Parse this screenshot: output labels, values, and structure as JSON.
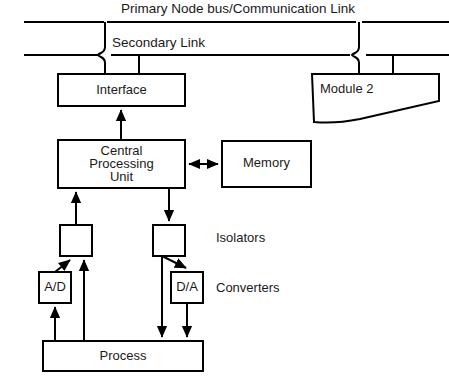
{
  "diagram": {
    "stroke_color": "#000000",
    "fill_color": "#ffffff",
    "text_color": "#1a1a1a",
    "labels": {
      "primary_bus": "Primary Node bus/Communication Link",
      "secondary_link": "Secondary Link",
      "interface": "Interface",
      "module_2": "Module 2",
      "cpu_line_1": "Central",
      "cpu_line_2": "Processing",
      "cpu_line_3": "Unit",
      "memory": "Memory",
      "isolators": "Isolators",
      "converters": "Converters",
      "analog_to_digital": "A/D",
      "digital_to_analog": "D/A",
      "process": "Process"
    },
    "blocks": [
      {
        "id": "interface",
        "label": "Interface",
        "x": 58,
        "y": 74,
        "w": 127,
        "h": 32
      },
      {
        "id": "module-2",
        "label": "Module 2",
        "x": 312,
        "y": 74,
        "w": 127,
        "h": 32
      },
      {
        "id": "cpu",
        "label": "Central Processing Unit",
        "x": 58,
        "y": 140,
        "w": 127,
        "h": 48
      },
      {
        "id": "memory",
        "label": "Memory",
        "x": 222,
        "y": 141,
        "w": 89,
        "h": 46
      },
      {
        "id": "isolator-left",
        "label": "",
        "x": 60,
        "y": 225,
        "w": 32,
        "h": 31
      },
      {
        "id": "isolator-right",
        "label": "",
        "x": 153,
        "y": 225,
        "w": 32,
        "h": 31
      },
      {
        "id": "ad-converter",
        "label": "A/D",
        "x": 39,
        "y": 272,
        "w": 32,
        "h": 31
      },
      {
        "id": "da-converter",
        "label": "D/A",
        "x": 171,
        "y": 272,
        "w": 32,
        "h": 31
      },
      {
        "id": "process",
        "label": "Process",
        "x": 43,
        "y": 341,
        "w": 160,
        "h": 30
      }
    ],
    "connections": [
      {
        "from": "primary-bus",
        "to": "interface",
        "type": "line"
      },
      {
        "from": "secondary-link",
        "to": "interface",
        "type": "line"
      },
      {
        "from": "primary-bus",
        "to": "module-2",
        "type": "line"
      },
      {
        "from": "secondary-link",
        "to": "module-2",
        "type": "line"
      },
      {
        "from": "interface",
        "to": "cpu",
        "type": "arrow-up"
      },
      {
        "from": "cpu",
        "to": "memory",
        "type": "arrow-bidirectional"
      },
      {
        "from": "isolator-left",
        "to": "cpu",
        "type": "arrow-up"
      },
      {
        "from": "cpu",
        "to": "isolator-right",
        "type": "arrow-down"
      },
      {
        "from": "ad-converter",
        "to": "isolator-left",
        "type": "arrow-diagonal-up"
      },
      {
        "from": "process",
        "to": "isolator-left",
        "type": "arrow-up"
      },
      {
        "from": "isolator-right",
        "to": "da-converter",
        "type": "arrow-diagonal-down"
      },
      {
        "from": "isolator-right",
        "to": "process",
        "type": "arrow-down"
      },
      {
        "from": "process",
        "to": "ad-converter",
        "type": "arrow-up"
      },
      {
        "from": "da-converter",
        "to": "process",
        "type": "arrow-down"
      }
    ]
  }
}
